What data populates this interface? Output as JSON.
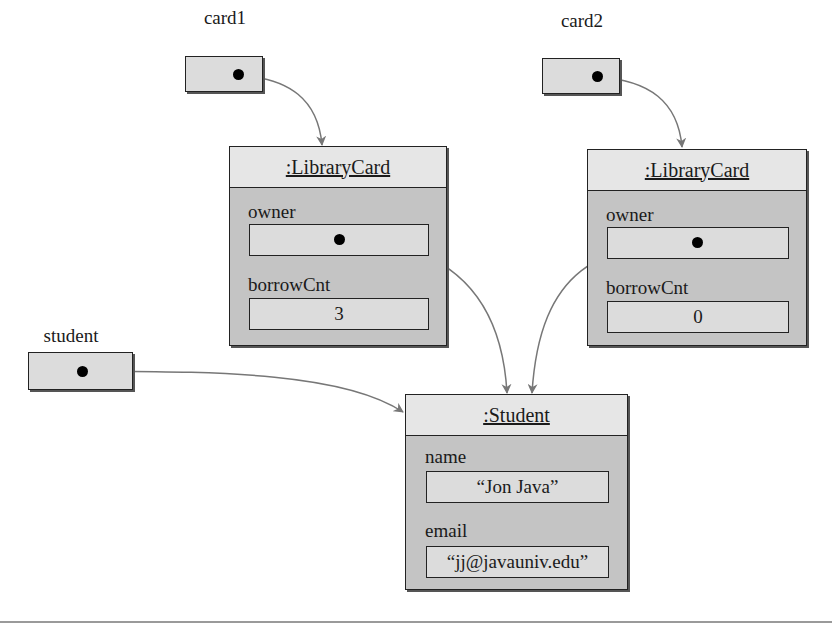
{
  "diagram": {
    "type": "object-reference-diagram",
    "references": [
      {
        "id": "card1",
        "label": "card1",
        "points_to": "librarycard1"
      },
      {
        "id": "card2",
        "label": "card2",
        "points_to": "librarycard2"
      },
      {
        "id": "student",
        "label": "student",
        "points_to": "student_obj"
      }
    ],
    "objects": [
      {
        "id": "librarycard1",
        "title": ":LibraryCard",
        "fields": [
          {
            "name": "owner",
            "value": "",
            "is_reference": true,
            "points_to": "student_obj"
          },
          {
            "name": "borrowCnt",
            "value": "3",
            "is_reference": false
          }
        ]
      },
      {
        "id": "librarycard2",
        "title": ":LibraryCard",
        "fields": [
          {
            "name": "owner",
            "value": "",
            "is_reference": true,
            "points_to": "student_obj"
          },
          {
            "name": "borrowCnt",
            "value": "0",
            "is_reference": false
          }
        ]
      },
      {
        "id": "student_obj",
        "title": ":Student",
        "fields": [
          {
            "name": "name",
            "value": "“Jon Java”",
            "is_reference": false
          },
          {
            "name": "email",
            "value": "“jj@javauniv.edu”",
            "is_reference": false
          }
        ]
      }
    ],
    "colors": {
      "object_body": "#c4c4c4",
      "object_header": "#e6e6e6",
      "reference_box": "#dcdcdc",
      "arrow": "#777777",
      "dot": "#000000"
    }
  }
}
